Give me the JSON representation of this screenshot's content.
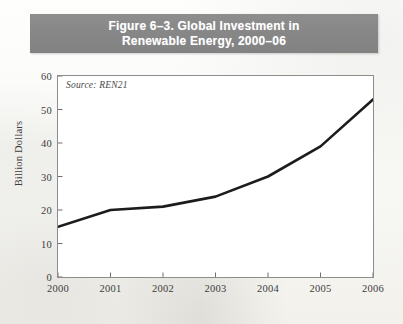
{
  "figure": {
    "title_line1": "Figure 6–3. Global Investment in",
    "title_line2": "Renewable Energy, 2000–06",
    "banner_color": "#878787",
    "source_note": "Source: REN21"
  },
  "chart_data": {
    "type": "line",
    "title": "Figure 6–3. Global Investment in Renewable Energy, 2000–06",
    "source": "Source: REN21",
    "xlabel": "",
    "ylabel": "Billion Dollars",
    "categories": [
      "2000",
      "2001",
      "2002",
      "2003",
      "2004",
      "2005",
      "2006"
    ],
    "x": [
      2000,
      2001,
      2002,
      2003,
      2004,
      2005,
      2006
    ],
    "values": [
      15,
      20,
      21,
      24,
      30,
      39,
      53
    ],
    "series": [
      {
        "name": "Global investment in renewable energy",
        "values": [
          15,
          20,
          21,
          24,
          30,
          39,
          53
        ],
        "color": "#1c1c1c"
      }
    ],
    "xlim": [
      2000,
      2006
    ],
    "ylim": [
      0,
      60
    ],
    "yticks": [
      0,
      10,
      20,
      30,
      40,
      50,
      60
    ],
    "ytick_labels": [
      "0",
      "10",
      "20",
      "30",
      "40",
      "50",
      "60"
    ],
    "xticks": [
      2000,
      2001,
      2002,
      2003,
      2004,
      2005,
      2006
    ],
    "xtick_labels": [
      "2000",
      "2001",
      "2002",
      "2003",
      "2004",
      "2005",
      "2006"
    ],
    "grid": false,
    "legend": false,
    "line_color": "#1c1c1c",
    "line_width": 2.6,
    "plot_background": "#ffffff",
    "frame_color": "#8d8d8d"
  }
}
